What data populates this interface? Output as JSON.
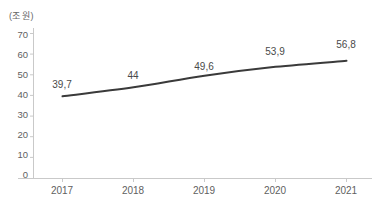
{
  "chart_data": {
    "type": "line",
    "title": "",
    "unit_label": "(조 원)",
    "xlabel": "",
    "ylabel": "",
    "categories": [
      "2017",
      "2018",
      "2019",
      "2020",
      "2021"
    ],
    "values": [
      39.7,
      44,
      49.6,
      53.9,
      56.8
    ],
    "point_labels": [
      "39,7",
      "44",
      "49,6",
      "53,9",
      "56,8"
    ],
    "yticks": [
      "70",
      "60",
      "50",
      "40",
      "30",
      "20",
      "10",
      "0"
    ],
    "ytick_values": [
      70,
      60,
      50,
      40,
      30,
      20,
      10,
      0
    ],
    "ylim": [
      0,
      70
    ],
    "grid": false,
    "legend": false,
    "series": [
      {
        "name": "",
        "values": [
          39.7,
          44,
          49.6,
          53.9,
          56.8
        ]
      }
    ],
    "colors": {
      "line": "#3a3a3a",
      "axis": "#c9c9c9",
      "tick_text": "#5f5f5f",
      "label_text": "#4a4a4a",
      "background": "#ffffff"
    }
  }
}
